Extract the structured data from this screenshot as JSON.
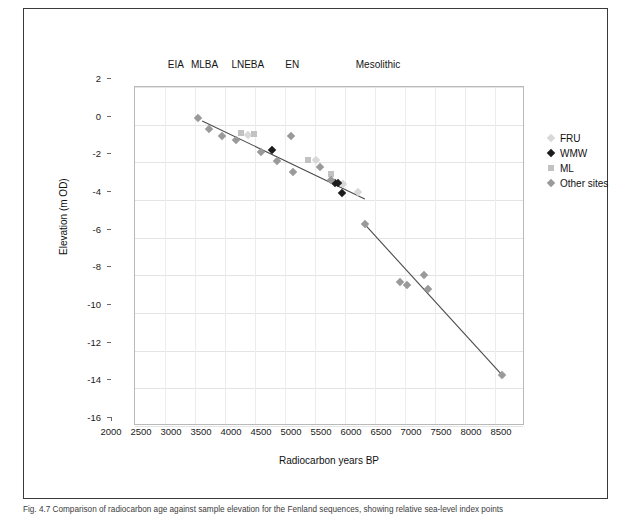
{
  "figure": {
    "caption": "Fig. 4.7  Comparison of radiocarbon age against sample elevation for the Fenland sequences, showing relative sea-level index points"
  },
  "chart_data": {
    "type": "scatter",
    "title": "",
    "xlabel": "Radiocarbon years BP",
    "ylabel": "Elevation (m OD)",
    "xlim": [
      2000,
      8500
    ],
    "ylim": [
      -16,
      2
    ],
    "xticks": [
      2000,
      2500,
      3000,
      3500,
      4000,
      4500,
      5000,
      5500,
      6000,
      6500,
      7000,
      7500,
      8000,
      8500
    ],
    "yticks": [
      2,
      0,
      -2,
      -4,
      -6,
      -8,
      -10,
      -12,
      -14,
      -16
    ],
    "xtick_labels": [
      "2000",
      "2500",
      "3000",
      "3500",
      "4000",
      "4500",
      "5000",
      "5500",
      "6000",
      "6500",
      "7000",
      "7500",
      "8000",
      "8500"
    ],
    "ytick_labels": [
      "2",
      "0",
      "-2",
      "-4",
      "-6",
      "-8",
      "-10",
      "-12",
      "-14",
      "-16"
    ],
    "grid": true,
    "legend_position": "right",
    "period_labels": [
      {
        "label": "EIA",
        "x": 3080
      },
      {
        "label": "MLBA",
        "x": 3560
      },
      {
        "label": "LNEBA",
        "x": 4280
      },
      {
        "label": "EN",
        "x": 5020
      },
      {
        "label": "Mesolithic",
        "x": 6450
      }
    ],
    "series": [
      {
        "name": "FRU",
        "marker": "diamond",
        "color": "#d8d8d8",
        "points": [
          {
            "x": 3880,
            "y": -0.55
          },
          {
            "x": 5010,
            "y": -1.9
          },
          {
            "x": 5460,
            "y": -3.15
          },
          {
            "x": 5720,
            "y": -3.6
          }
        ]
      },
      {
        "name": "WMW",
        "marker": "diamond",
        "color": "#1c1c1c",
        "points": [
          {
            "x": 4290,
            "y": -1.35
          },
          {
            "x": 5330,
            "y": -3.1
          },
          {
            "x": 5390,
            "y": -3.1
          },
          {
            "x": 5450,
            "y": -3.65
          }
        ]
      },
      {
        "name": "ML",
        "marker": "square",
        "color": "#c2c2c2",
        "points": [
          {
            "x": 3760,
            "y": -0.45
          },
          {
            "x": 3990,
            "y": -0.5
          },
          {
            "x": 4880,
            "y": -1.85
          },
          {
            "x": 5260,
            "y": -2.6
          }
        ]
      },
      {
        "name": "Other sites",
        "marker": "diamond",
        "color": "#9a9a9a",
        "points": [
          {
            "x": 3050,
            "y": 0.35
          },
          {
            "x": 3240,
            "y": -0.25
          },
          {
            "x": 3450,
            "y": -0.6
          },
          {
            "x": 3690,
            "y": -0.8
          },
          {
            "x": 4100,
            "y": -1.45
          },
          {
            "x": 4370,
            "y": -1.95
          },
          {
            "x": 4600,
            "y": -0.6
          },
          {
            "x": 4640,
            "y": -2.5
          },
          {
            "x": 5090,
            "y": -2.25
          },
          {
            "x": 5260,
            "y": -2.95
          },
          {
            "x": 5830,
            "y": -5.3
          },
          {
            "x": 6420,
            "y": -8.35
          },
          {
            "x": 6530,
            "y": -8.5
          },
          {
            "x": 6820,
            "y": -8.0
          },
          {
            "x": 6880,
            "y": -8.7
          },
          {
            "x": 8120,
            "y": -13.3
          }
        ]
      }
    ],
    "trendlines": [
      {
        "name": "upper-regression",
        "x1": 3120,
        "y1": 0.2,
        "x2": 5830,
        "y2": -3.95,
        "color": "#4a4a4a"
      },
      {
        "name": "lower-regression",
        "x1": 5830,
        "y1": -5.3,
        "x2": 8150,
        "y2": -13.4,
        "color": "#4a4a4a"
      }
    ]
  },
  "legend": {
    "items": [
      {
        "label": "FRU",
        "color": "#d8d8d8",
        "marker": "diamond"
      },
      {
        "label": "WMW",
        "color": "#1c1c1c",
        "marker": "diamond"
      },
      {
        "label": "ML",
        "color": "#c2c2c2",
        "marker": "square"
      },
      {
        "label": "Other sites",
        "color": "#9a9a9a",
        "marker": "diamond"
      }
    ]
  }
}
